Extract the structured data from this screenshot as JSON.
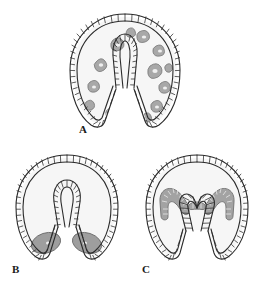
{
  "figure": {
    "background_color": "#ffffff",
    "ink_color": "#2b2b2b",
    "cell_fill_color": "#f2f2f2",
    "mesenchyme_color": "#9a9a9a",
    "mesenchyme_outline_color": "#6f6f6f",
    "coelom_color": "#a0a0a0",
    "panel_count": 3
  },
  "panels": [
    {
      "id": "A",
      "label": "A",
      "label_position": "bottom-left",
      "stage_name": "late gastrula with migrating mesenchyme",
      "features": {
        "outer_epithelium": "ectoderm cell layer, closed U-shaped wall",
        "inner_tube": "archenteron, elongated and blind-ended",
        "blastocoel_contents": "scattered mesenchyme cells",
        "mesenchyme_cell_count": 14,
        "coelomic_pouches": "none"
      }
    },
    {
      "id": "B",
      "label": "B",
      "label_position": "bottom-left",
      "stage_name": "gastrula with mesenchyme aggregated at vegetal base",
      "features": {
        "outer_epithelium": "ectoderm cell layer, closed U-shaped wall",
        "inner_tube": "archenteron, shorter and rounded",
        "blastocoel_contents": "two solid mesenchyme masses near blastopore",
        "mesenchyme_cell_count": 2,
        "coelomic_pouches": "none"
      }
    },
    {
      "id": "C",
      "label": "C",
      "label_position": "bottom-left",
      "stage_name": "gastrula with paired coelomic pouches at archenteron tip",
      "features": {
        "outer_epithelium": "ectoderm cell layer, closed U-shaped wall",
        "inner_tube": "archenteron, wide with splayed limbs",
        "blastocoel_contents": "paired coelomic pouches forming antler shape",
        "mesenchyme_cell_count": 0,
        "coelomic_pouches": "two lateral pouches plus central cap"
      }
    }
  ],
  "labels": {
    "a": "A",
    "b": "B",
    "c": "C"
  }
}
